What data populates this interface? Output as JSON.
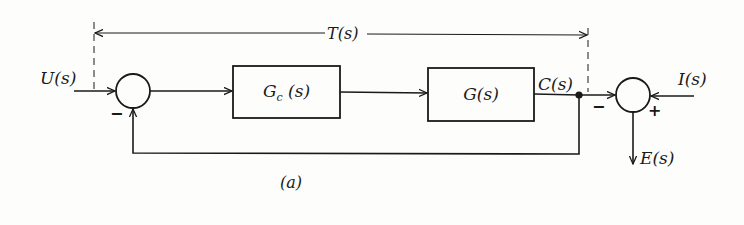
{
  "diagram": {
    "type": "block-diagram",
    "caption": "(a)",
    "span_label": "T(s)",
    "signals": {
      "input": "U(s)",
      "output": "C(s)",
      "disturbance": "I(s)",
      "error": "E(s)"
    },
    "blocks": [
      {
        "id": "controller",
        "label_main": "G",
        "label_sub": "c",
        "label_tail": " (s)"
      },
      {
        "id": "plant",
        "label_main": "G(s)"
      }
    ],
    "summing_junctions": [
      {
        "id": "sum1",
        "signs": {
          "feedback": "−"
        }
      },
      {
        "id": "sum2",
        "signs": {
          "left_input": "−",
          "right_input": "+"
        }
      }
    ],
    "colors": {
      "line": "#1a1a1a",
      "background": "#fdfdfc"
    }
  }
}
